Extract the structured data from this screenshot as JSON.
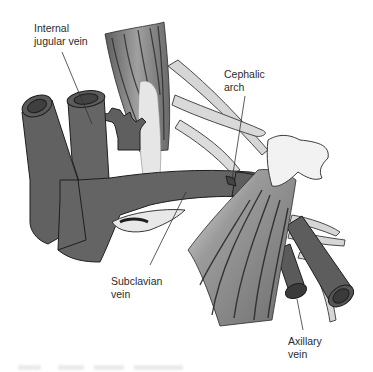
{
  "diagram": {
    "labels": {
      "internal_jugular": "Internal\njugular vein",
      "cephalic_arch": "Cephalic\narch",
      "subclavian": "Subclavian\nvein",
      "axillary": "Axillary\nvein"
    },
    "structures": [
      "internal-jugular-vein",
      "external-jugular-vein",
      "subclavian-vein",
      "axillary-vein",
      "cephalic-vein",
      "clavicle",
      "muscle-bundle-upper",
      "muscle-bundle-lower",
      "coracoid-process",
      "brachial-plexus-nerves"
    ],
    "colors": {
      "vein_fill": "#636363",
      "vein_lumen": "#4a4a4a",
      "vein_outline": "#1e1e1e",
      "muscle": "#8a8a8a",
      "muscle_stripe": "#3a3a3a",
      "tendon": "#dedede",
      "nerve": "#d4d4d4",
      "bone": "#f0f0f0",
      "text": "#2b2b2b",
      "leader": "#333333"
    }
  }
}
